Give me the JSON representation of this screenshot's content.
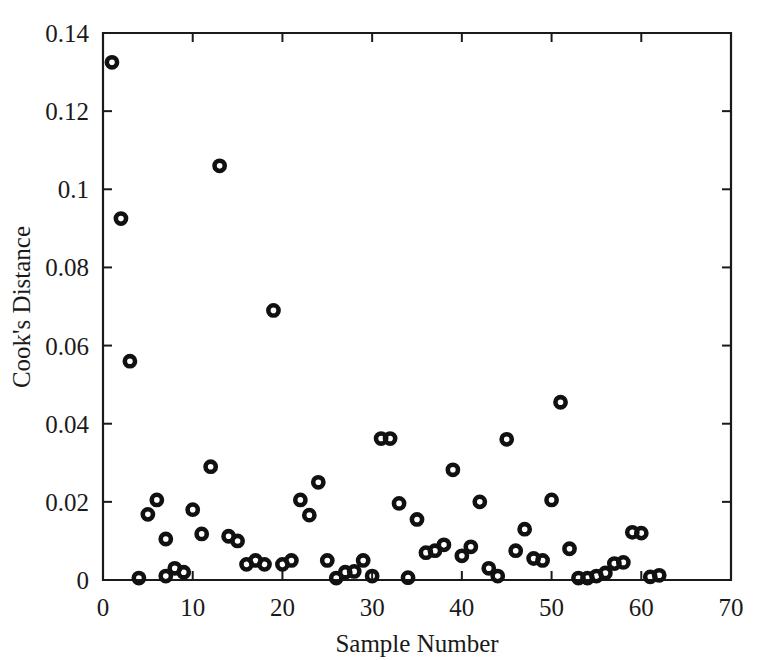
{
  "chart_data": {
    "type": "scatter",
    "title": "",
    "xlabel": "Sample Number",
    "ylabel": "Cook's Distance",
    "xlim": [
      0,
      70
    ],
    "ylim": [
      0,
      0.14
    ],
    "xticks": [
      0,
      10,
      20,
      30,
      40,
      50,
      60,
      70
    ],
    "xticklabels": [
      "0",
      "10",
      "20",
      "30",
      "40",
      "50",
      "60",
      "70"
    ],
    "yticks": [
      0,
      0.02,
      0.04,
      0.06,
      0.08,
      0.1,
      0.12,
      0.14
    ],
    "yticklabels": [
      "0",
      "0.02",
      "0.04",
      "0.06",
      "0.08",
      "0.1",
      "0.12",
      "0.14"
    ],
    "grid": false,
    "legend": null,
    "marker": "open-circle",
    "marker_color": "#111111",
    "series": [
      {
        "name": "Cook's Distance",
        "x": [
          1,
          2,
          3,
          4,
          5,
          6,
          7,
          7,
          8,
          9,
          10,
          11,
          12,
          13,
          14,
          15,
          16,
          17,
          18,
          19,
          20,
          21,
          22,
          23,
          24,
          25,
          26,
          27,
          28,
          29,
          30,
          31,
          32,
          33,
          34,
          35,
          36,
          37,
          38,
          39,
          40,
          41,
          42,
          43,
          44,
          45,
          46,
          47,
          48,
          49,
          50,
          51,
          52,
          53,
          54,
          55,
          56,
          57,
          58,
          59,
          60,
          61,
          62
        ],
        "y": [
          0.1325,
          0.0925,
          0.056,
          0.0005,
          0.0168,
          0.0205,
          0.0105,
          0.001,
          0.003,
          0.002,
          0.018,
          0.0118,
          0.029,
          0.106,
          0.0112,
          0.01,
          0.004,
          0.005,
          0.004,
          0.069,
          0.004,
          0.005,
          0.0205,
          0.0166,
          0.025,
          0.005,
          0.0005,
          0.002,
          0.0022,
          0.005,
          0.001,
          0.0362,
          0.0362,
          0.0196,
          0.0006,
          0.0155,
          0.007,
          0.0075,
          0.009,
          0.0282,
          0.0062,
          0.0085,
          0.02,
          0.003,
          0.001,
          0.036,
          0.0075,
          0.013,
          0.0055,
          0.005,
          0.0205,
          0.0455,
          0.008,
          0.0005,
          0.0005,
          0.001,
          0.0018,
          0.0042,
          0.0045,
          0.0122,
          0.012,
          0.0008,
          0.0012
        ]
      }
    ]
  },
  "figure": {
    "background_color": "#ffffff",
    "foreground_color": "#1a1a1a"
  }
}
